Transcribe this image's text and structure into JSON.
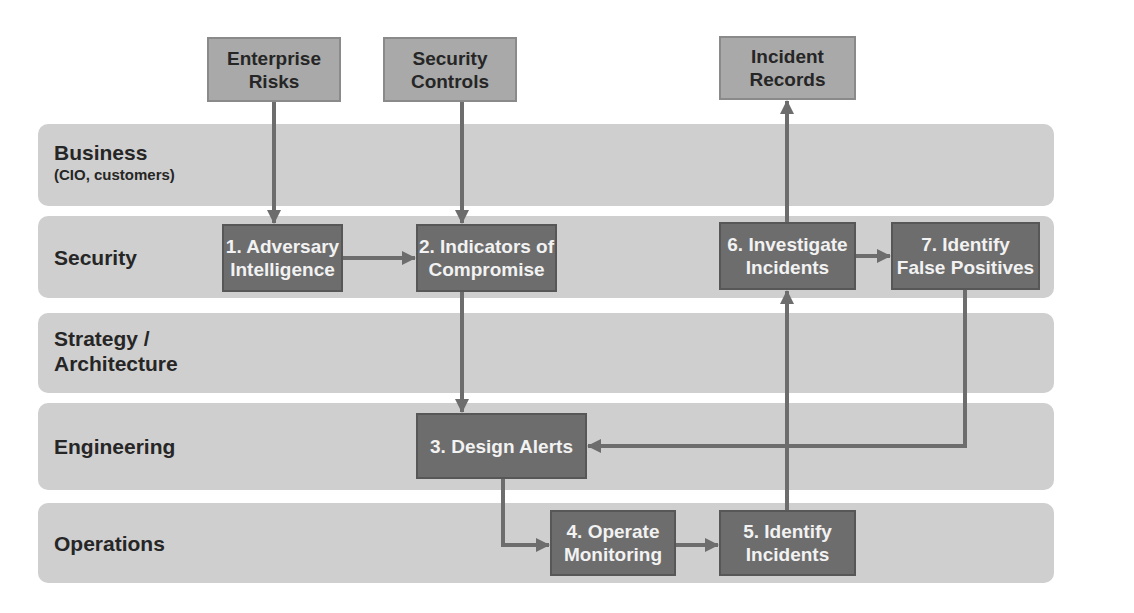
{
  "colors": {
    "lane_fill": "#cfcfcf",
    "input_box_fill": "#a9a9a9",
    "step_box_fill": "#6d6d6d",
    "arrow": "#6d6d6d",
    "lane_text": "#262626",
    "step_text": "#f2f2f2"
  },
  "lanes": [
    {
      "id": "business",
      "label": "Business",
      "sublabel": "(CIO, customers)"
    },
    {
      "id": "security",
      "label": "Security",
      "sublabel": ""
    },
    {
      "id": "strategy",
      "label": "Strategy /\nArchitecture",
      "sublabel": ""
    },
    {
      "id": "engineering",
      "label": "Engineering",
      "sublabel": ""
    },
    {
      "id": "operations",
      "label": "Operations",
      "sublabel": ""
    }
  ],
  "inputs": [
    {
      "id": "enterprise-risks",
      "label": "Enterprise\nRisks"
    },
    {
      "id": "security-controls",
      "label": "Security\nControls"
    },
    {
      "id": "incident-records",
      "label": "Incident\nRecords"
    }
  ],
  "steps": [
    {
      "id": "step-1",
      "label": "1. Adversary\nIntelligence",
      "lane": "security"
    },
    {
      "id": "step-2",
      "label": "2. Indicators of\nCompromise",
      "lane": "security"
    },
    {
      "id": "step-3",
      "label": "3. Design Alerts",
      "lane": "engineering"
    },
    {
      "id": "step-4",
      "label": "4. Operate\nMonitoring",
      "lane": "operations"
    },
    {
      "id": "step-5",
      "label": "5. Identify\nIncidents",
      "lane": "operations"
    },
    {
      "id": "step-6",
      "label": "6. Investigate\nIncidents",
      "lane": "security"
    },
    {
      "id": "step-7",
      "label": "7. Identify\nFalse Positives",
      "lane": "security"
    }
  ],
  "edges": [
    {
      "from": "enterprise-risks",
      "to": "step-1"
    },
    {
      "from": "security-controls",
      "to": "step-2"
    },
    {
      "from": "step-1",
      "to": "step-2"
    },
    {
      "from": "step-2",
      "to": "step-3"
    },
    {
      "from": "step-3",
      "to": "step-4"
    },
    {
      "from": "step-4",
      "to": "step-5"
    },
    {
      "from": "step-5",
      "to": "step-6"
    },
    {
      "from": "step-6",
      "to": "incident-records"
    },
    {
      "from": "step-6",
      "to": "step-7"
    },
    {
      "from": "step-7",
      "to": "step-3"
    }
  ]
}
